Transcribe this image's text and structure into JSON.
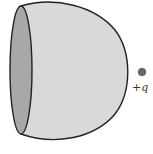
{
  "diagram": {
    "type": "physics-electrostatics",
    "surface": {
      "description": "open hemispherical shell with circular opening",
      "fill": "#d9d9d9",
      "opening_fill": "#a8a8a8",
      "stroke": "#222222"
    },
    "charge": {
      "label": "+q",
      "color": "#666666"
    }
  }
}
